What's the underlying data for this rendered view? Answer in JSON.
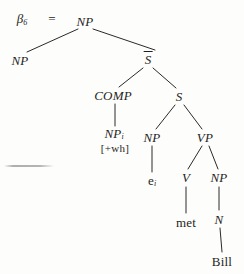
{
  "figure": {
    "label_text": "β",
    "label_subscript": "6",
    "equals_sign": "="
  },
  "tree": {
    "type": "syntax-tree",
    "nodes": [
      {
        "id": "root-np",
        "label": "NP",
        "sub": "",
        "x": 85,
        "y": 21,
        "style": "italic"
      },
      {
        "id": "left-np",
        "label": "NP",
        "sub": "",
        "x": 20,
        "y": 60,
        "style": "italic"
      },
      {
        "id": "sbar",
        "label": "S",
        "sub": "",
        "x": 148,
        "y": 59,
        "style": "italic-overbar"
      },
      {
        "id": "comp",
        "label": "COMP",
        "sub": "",
        "x": 113,
        "y": 95,
        "style": "italic"
      },
      {
        "id": "s",
        "label": "S",
        "sub": "",
        "x": 179,
        "y": 96,
        "style": "italic"
      },
      {
        "id": "comp-np",
        "label": "NP",
        "sub": "i",
        "x": 114,
        "y": 134,
        "style": "italic"
      },
      {
        "id": "subj-np",
        "label": "NP",
        "sub": "",
        "x": 152,
        "y": 137,
        "style": "italic"
      },
      {
        "id": "vp",
        "label": "VP",
        "sub": "",
        "x": 205,
        "y": 137,
        "style": "italic"
      },
      {
        "id": "trace",
        "label": "e",
        "sub": "i",
        "x": 152,
        "y": 181,
        "style": "upright"
      },
      {
        "id": "v",
        "label": "V",
        "sub": "",
        "x": 186,
        "y": 177,
        "style": "italic"
      },
      {
        "id": "obj-np",
        "label": "NP",
        "sub": "",
        "x": 219,
        "y": 177,
        "style": "italic"
      },
      {
        "id": "met",
        "label": "met",
        "sub": "",
        "x": 186,
        "y": 222,
        "style": "upright"
      },
      {
        "id": "n",
        "label": "N",
        "sub": "",
        "x": 219,
        "y": 219,
        "style": "italic"
      },
      {
        "id": "bill",
        "label": "Bill",
        "sub": "",
        "x": 222,
        "y": 261,
        "style": "upright"
      }
    ],
    "feature_bundle": {
      "id": "wh-feature",
      "text": "[+wh]",
      "x": 115,
      "y": 148
    },
    "edges": [
      {
        "from": "root-np",
        "to": "left-np",
        "x1": 78,
        "y1": 29,
        "x2": 27,
        "y2": 52
      },
      {
        "from": "root-np",
        "to": "sbar",
        "x1": 93,
        "y1": 29,
        "x2": 155,
        "y2": 50
      },
      {
        "from": "sbar",
        "to": "comp",
        "x1": 143,
        "y1": 68,
        "x2": 119,
        "y2": 87
      },
      {
        "from": "sbar",
        "to": "s",
        "x1": 153,
        "y1": 68,
        "x2": 176,
        "y2": 88
      },
      {
        "from": "comp",
        "to": "comp-np",
        "x1": 115,
        "y1": 104,
        "x2": 115,
        "y2": 126
      },
      {
        "from": "s",
        "to": "subj-np",
        "x1": 175,
        "y1": 105,
        "x2": 156,
        "y2": 129
      },
      {
        "from": "s",
        "to": "vp",
        "x1": 184,
        "y1": 105,
        "x2": 202,
        "y2": 129
      },
      {
        "from": "subj-np",
        "to": "trace",
        "x1": 152,
        "y1": 146,
        "x2": 152,
        "y2": 172
      },
      {
        "from": "vp",
        "to": "v",
        "x1": 202,
        "y1": 146,
        "x2": 188,
        "y2": 169
      },
      {
        "from": "vp",
        "to": "obj-np",
        "x1": 209,
        "y1": 146,
        "x2": 218,
        "y2": 169
      },
      {
        "from": "v",
        "to": "met",
        "x1": 186,
        "y1": 187,
        "x2": 186,
        "y2": 213
      },
      {
        "from": "obj-np",
        "to": "n",
        "x1": 219,
        "y1": 187,
        "x2": 219,
        "y2": 210
      },
      {
        "from": "n",
        "to": "bill",
        "x1": 220,
        "y1": 228,
        "x2": 222,
        "y2": 252
      }
    ]
  },
  "artifact": {
    "name": "scan-artifact-line",
    "x": 4,
    "y": 165,
    "width": 50,
    "height": 2
  },
  "colors": {
    "ink": "#1f1f1f",
    "page_background": "#fdfdfb"
  }
}
